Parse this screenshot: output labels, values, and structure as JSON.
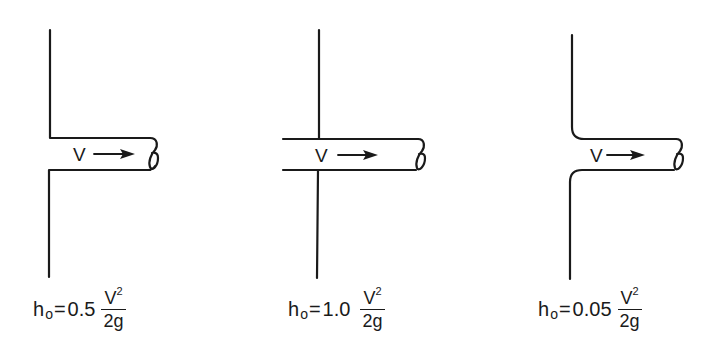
{
  "figure": {
    "panels": [
      {
        "id": "square-edged",
        "type": "square-edged entrance",
        "velocity_label": "V",
        "formula": {
          "symbol": "h",
          "subscript": "o",
          "equals": "=",
          "coefficient": "0.5",
          "numerator": "V",
          "exponent": "2",
          "denominator": "2g"
        }
      },
      {
        "id": "reentrant",
        "type": "re-entrant (projecting) entrance",
        "velocity_label": "V",
        "formula": {
          "symbol": "h",
          "subscript": "o",
          "equals": "=",
          "coefficient": "1.0",
          "numerator": "V",
          "exponent": "2",
          "denominator": "2g"
        }
      },
      {
        "id": "rounded",
        "type": "well-rounded (bell-mouth) entrance",
        "velocity_label": "V",
        "formula": {
          "symbol": "h",
          "subscript": "o",
          "equals": "=",
          "coefficient": "0.05",
          "numerator": "V",
          "exponent": "2",
          "denominator": "2g"
        }
      }
    ]
  },
  "colors": {
    "ink": "#1a1a1a",
    "background": "#ffffff"
  }
}
